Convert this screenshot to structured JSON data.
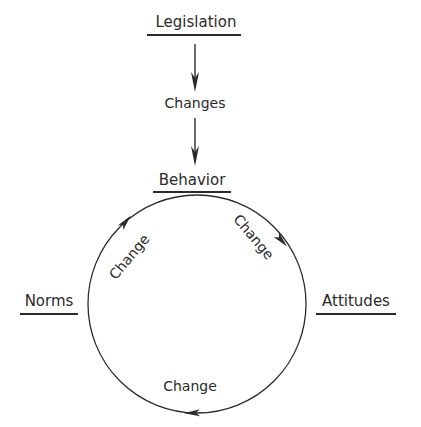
{
  "diagram": {
    "nodes": {
      "legislation": "Legislation",
      "behavior": "Behavior",
      "attitudes": "Attitudes",
      "norms": "Norms"
    },
    "edges": {
      "legislation_to_behavior": "Changes",
      "behavior_to_attitudes": "Change",
      "attitudes_to_norms": "Change",
      "norms_to_behavior": "Change"
    },
    "colors": {
      "ink": "#2a2a2a",
      "background": "#ffffff"
    }
  }
}
